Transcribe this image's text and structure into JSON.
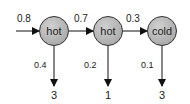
{
  "diagram": {
    "type": "hidden-markov-model-trellis",
    "start_prob": "0.8",
    "states": [
      {
        "label": "hot",
        "emission_prob": "0.4",
        "observation": "3"
      },
      {
        "label": "hot",
        "emission_prob": "0.2",
        "observation": "1"
      },
      {
        "label": "cold",
        "emission_prob": "0.1",
        "observation": "3"
      }
    ],
    "transitions": [
      {
        "from": 0,
        "to": 1,
        "prob": "0.7"
      },
      {
        "from": 1,
        "to": 2,
        "prob": "0.3"
      }
    ],
    "colors": {
      "node_fill": "#b4b4b4",
      "node_stroke": "#333333",
      "edge": "#111111"
    }
  }
}
